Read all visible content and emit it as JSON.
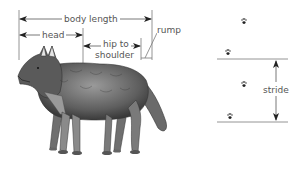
{
  "diagram": {
    "measurements": {
      "body_length": "body length",
      "head": "head",
      "hip_to_shoulder_line1": "hip to",
      "hip_to_shoulder_line2": "shoulder",
      "rump": "rump"
    },
    "track": {
      "stride": "stride",
      "paw_prints": 4
    },
    "colors": {
      "line": "#7a7a7a",
      "arrow": "#222222",
      "text": "#555555",
      "fur_dark": "#3a3a3a",
      "fur_mid": "#7d7d7d",
      "fur_light": "#bdbdbd"
    }
  }
}
